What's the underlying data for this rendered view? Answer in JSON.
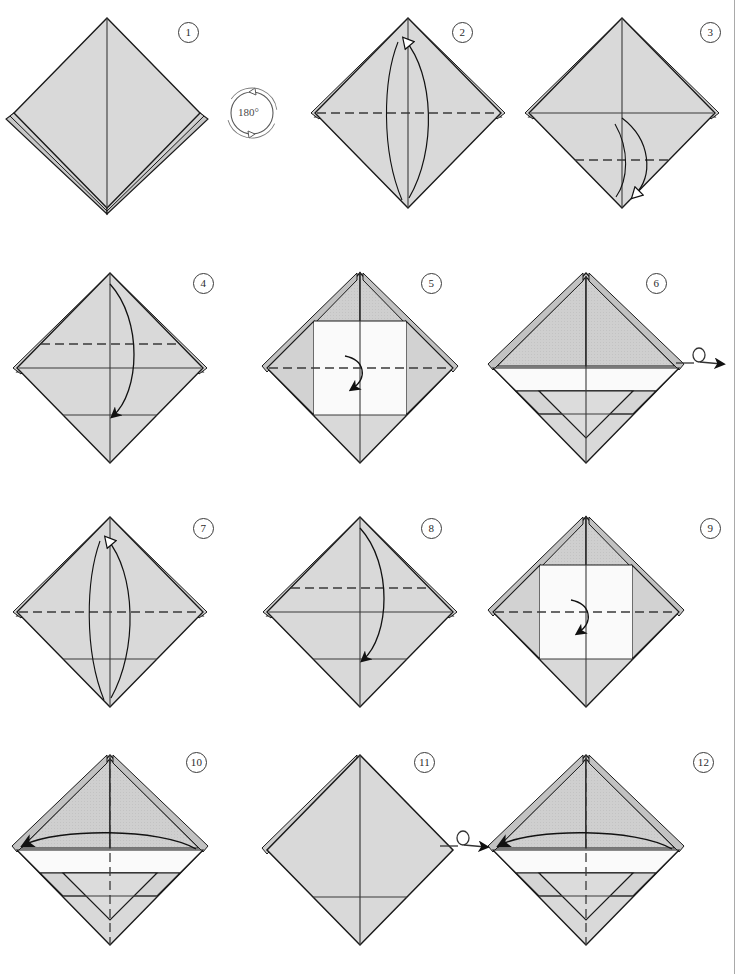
{
  "document": {
    "type": "origami-folding-diagram",
    "title": "",
    "page_width": 747,
    "page_height": 974,
    "background_color": "#ffffff",
    "has_right_margin_rule": true
  },
  "palette": {
    "paper_light": "#d9d9d9",
    "paper_mid": "#cbcbcb",
    "paper_dark": "#bdbdbd",
    "paper_white": "#fbfbfb",
    "outline": "#1a1a1a",
    "crease_line": "#3a3a3a",
    "dashed_line": "#4a4a4a",
    "number_ring": "#3a3a3a",
    "symbol_ink": "#4a4a4a"
  },
  "symbols": [
    {
      "name": "rotate-180-symbol",
      "label": "180°",
      "meaning": "turn the model 180 degrees in the plane",
      "x": 238,
      "y": 80
    },
    {
      "name": "turn-over-symbol-row2",
      "label": "",
      "meaning": "turn the model over",
      "x": 676,
      "y": 348
    },
    {
      "name": "turn-over-symbol-row4",
      "label": "",
      "meaning": "turn the model over",
      "x": 458,
      "y": 830
    }
  ],
  "steps": [
    {
      "number": "1",
      "number_label": "1",
      "badge_x": 178,
      "badge_y": 22,
      "cx": 107,
      "cy": 113,
      "r": 95,
      "description": "Preliminary-base diamond, plain front with centre crease and layered lower edges",
      "has_vertical_crease": true,
      "has_center_horizontal": false,
      "dashed": [],
      "solid_creases": [],
      "arrows": [],
      "layers": "double-flap-bottom"
    },
    {
      "number": "2",
      "number_label": "2",
      "badge_x": 452,
      "badge_y": 22,
      "cx": 408,
      "cy": 113,
      "r": 95,
      "description": "Dashed horizontal crease across the middle; hollow arrow folds the front flap up",
      "has_vertical_crease": true,
      "has_center_horizontal": false,
      "dashed": [
        "center-horizontal"
      ],
      "solid_creases": [],
      "arrows": [
        {
          "style": "hollow",
          "direction": "up",
          "path": "front-flap-up"
        }
      ],
      "layers": "upper-side-flaps"
    },
    {
      "number": "3",
      "number_label": "3",
      "badge_x": 700,
      "badge_y": 22,
      "cx": 622,
      "cy": 113,
      "r": 95,
      "description": "Solid horizontal crease at middle; dashed crease lower down; hollow arrow folds point down",
      "has_vertical_crease": true,
      "has_center_horizontal": true,
      "dashed": [
        "lower-quarter-horizontal"
      ],
      "solid_creases": [
        "center-horizontal"
      ],
      "arrows": [
        {
          "style": "hollow",
          "direction": "down",
          "path": "point-down"
        }
      ],
      "layers": "upper-side-flaps"
    },
    {
      "number": "4",
      "number_label": "4",
      "badge_x": 193,
      "badge_y": 273,
      "cx": 110,
      "cy": 368,
      "r": 95,
      "description": "Dashed crease above centre; solid creases at centre and lower quarter; solid arrow folds top point down",
      "has_vertical_crease": true,
      "has_center_horizontal": true,
      "dashed": [
        "upper-quarter-horizontal"
      ],
      "solid_creases": [
        "center-horizontal",
        "lower-quarter-horizontal"
      ],
      "arrows": [
        {
          "style": "solid",
          "direction": "down",
          "path": "top-to-lower"
        }
      ],
      "layers": "upper-side-flaps"
    },
    {
      "number": "5",
      "number_label": "5",
      "badge_x": 421,
      "badge_y": 273,
      "cx": 360,
      "cy": 368,
      "r": 95,
      "description": "Top flaps folded down forming two shaded triangles; white band revealed; dashed crease on centre line with short solid arrow",
      "has_vertical_crease": true,
      "has_center_horizontal": true,
      "dashed": [
        "center-horizontal"
      ],
      "solid_creases": [
        "upper-quarter-horizontal",
        "lower-quarter-horizontal"
      ],
      "arrows": [
        {
          "style": "solid",
          "direction": "down",
          "path": "short-center-down"
        }
      ],
      "layers": "folded-triangles"
    },
    {
      "number": "6",
      "number_label": "6",
      "badge_x": 646,
      "badge_y": 273,
      "cx": 586,
      "cy": 368,
      "r": 95,
      "description": "Completed front: dark top triangles, white middle band, inverted V pleat below",
      "has_vertical_crease": true,
      "has_center_horizontal": true,
      "dashed": [],
      "solid_creases": [
        "center-horizontal",
        "lower-quarter-horizontal"
      ],
      "arrows": [],
      "layers": "finished-front"
    },
    {
      "number": "7",
      "number_label": "7",
      "badge_x": 193,
      "badge_y": 518,
      "cx": 110,
      "cy": 612,
      "r": 95,
      "description": "Model turned over; dashed crease across the middle; hollow arrow folds the flap up",
      "has_vertical_crease": true,
      "has_center_horizontal": false,
      "dashed": [
        "center-horizontal"
      ],
      "solid_creases": [
        "lower-quarter-horizontal"
      ],
      "arrows": [
        {
          "style": "hollow",
          "direction": "up",
          "path": "front-flap-up"
        }
      ],
      "layers": "upper-side-flaps"
    },
    {
      "number": "8",
      "number_label": "8",
      "badge_x": 421,
      "badge_y": 518,
      "cx": 360,
      "cy": 612,
      "r": 95,
      "description": "Dashed crease above centre; solid arrow folds top point down to lower crease",
      "has_vertical_crease": true,
      "has_center_horizontal": true,
      "dashed": [
        "upper-quarter-horizontal"
      ],
      "solid_creases": [
        "center-horizontal",
        "lower-quarter-horizontal"
      ],
      "arrows": [
        {
          "style": "solid",
          "direction": "down",
          "path": "top-to-lower"
        }
      ],
      "layers": "upper-side-flaps"
    },
    {
      "number": "9",
      "number_label": "9",
      "badge_x": 700,
      "badge_y": 518,
      "cx": 586,
      "cy": 612,
      "r": 95,
      "description": "Back side now matches step 5; dashed centre crease and short solid arrow",
      "has_vertical_crease": true,
      "has_center_horizontal": true,
      "dashed": [
        "center-horizontal"
      ],
      "solid_creases": [
        "upper-quarter-horizontal",
        "lower-quarter-horizontal"
      ],
      "arrows": [
        {
          "style": "solid",
          "direction": "down",
          "path": "short-center-down"
        }
      ],
      "layers": "folded-triangles"
    },
    {
      "number": "10",
      "number_label": "10",
      "badge_x": 193,
      "badge_y": 752,
      "cx": 110,
      "cy": 850,
      "r": 95,
      "description": "Vertical dashed crease down the centre; long horizontal arrow swings the right layer across to the left",
      "has_vertical_crease": false,
      "has_center_horizontal": true,
      "dashed": [
        "center-vertical"
      ],
      "solid_creases": [
        "center-horizontal",
        "lower-quarter-horizontal"
      ],
      "arrows": [
        {
          "style": "solid",
          "direction": "left",
          "path": "swing-layer-left"
        }
      ],
      "layers": "finished-front"
    },
    {
      "number": "11",
      "number_label": "11",
      "badge_x": 421,
      "badge_y": 752,
      "cx": 360,
      "cy": 850,
      "r": 95,
      "description": "Plain diamond after swinging the layer; centre vertical crease and one lower horizontal crease",
      "has_vertical_crease": true,
      "has_center_horizontal": false,
      "dashed": [],
      "solid_creases": [
        "lower-quarter-horizontal"
      ],
      "arrows": [],
      "layers": "plain"
    },
    {
      "number": "12",
      "number_label": "12",
      "badge_x": 700,
      "badge_y": 752,
      "cx": 586,
      "cy": 850,
      "r": 95,
      "description": "Turned over; same as step 10 on the other side, arrow swings a layer to the left",
      "has_vertical_crease": false,
      "has_center_horizontal": true,
      "dashed": [
        "center-vertical"
      ],
      "solid_creases": [
        "center-horizontal",
        "lower-quarter-horizontal"
      ],
      "arrows": [
        {
          "style": "solid",
          "direction": "left",
          "path": "swing-layer-left"
        }
      ],
      "layers": "finished-front"
    }
  ]
}
